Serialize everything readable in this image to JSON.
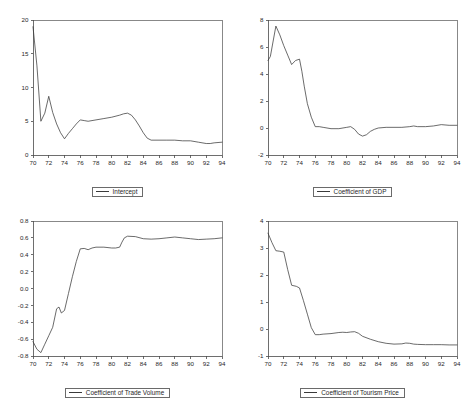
{
  "page": {
    "kind": "recursive-coefficient-estimates-panel",
    "panel_count": 4
  },
  "chart_data": [
    {
      "id": "intercept",
      "type": "line",
      "title": "",
      "xlabel": "",
      "ylabel": "",
      "legend": "Intercept",
      "legend_position": "bottom-center",
      "grid": false,
      "xlim": [
        70,
        94
      ],
      "ylim": [
        0,
        20
      ],
      "xticks": [
        70,
        72,
        74,
        76,
        78,
        80,
        82,
        84,
        86,
        88,
        90,
        92,
        94
      ],
      "yticks": [
        0,
        5,
        10,
        15,
        20
      ],
      "ytick_labels": [
        "0",
        "5",
        "10",
        "15",
        "20"
      ],
      "x": [
        70,
        70.5,
        71,
        71.5,
        72,
        72.5,
        73,
        73.5,
        74,
        74.5,
        75,
        75.5,
        76,
        76.5,
        77,
        78,
        79,
        80,
        81,
        81.5,
        82,
        82.5,
        83,
        83.5,
        84,
        84.5,
        85,
        86,
        87,
        88,
        89,
        90,
        91,
        92,
        92.5,
        93,
        94
      ],
      "values": [
        19.0,
        13.2,
        5.0,
        6.2,
        8.7,
        6.3,
        4.6,
        3.3,
        2.4,
        3.2,
        3.9,
        4.6,
        5.2,
        5.1,
        5.0,
        5.2,
        5.4,
        5.6,
        5.9,
        6.1,
        6.2,
        5.9,
        5.2,
        4.3,
        3.3,
        2.5,
        2.2,
        2.2,
        2.2,
        2.2,
        2.1,
        2.1,
        1.9,
        1.7,
        1.7,
        1.8,
        1.9
      ]
    },
    {
      "id": "coefficient-of-gdp",
      "type": "line",
      "title": "",
      "xlabel": "",
      "ylabel": "",
      "legend": "Coefficient of GDP",
      "legend_position": "bottom-center",
      "grid": false,
      "xlim": [
        70,
        94
      ],
      "ylim": [
        -2,
        8
      ],
      "xticks": [
        70,
        72,
        74,
        76,
        78,
        80,
        82,
        84,
        86,
        88,
        90,
        92,
        94
      ],
      "yticks": [
        -2,
        0,
        2,
        4,
        6,
        8
      ],
      "ytick_labels": [
        "-2",
        "0",
        "2",
        "4",
        "6",
        "8"
      ],
      "x": [
        70,
        70.3,
        71,
        71.5,
        72,
        72.5,
        73,
        73.5,
        74,
        74.3,
        74.6,
        75,
        75.5,
        76,
        76.5,
        77,
        78,
        79,
        80,
        80.5,
        81,
        81.5,
        82,
        82.5,
        83,
        83.5,
        84,
        85,
        86,
        87,
        88,
        88.5,
        89,
        90,
        91,
        92,
        93,
        94
      ],
      "values": [
        5.0,
        5.3,
        7.55,
        6.9,
        6.1,
        5.4,
        4.7,
        5.0,
        5.1,
        4.2,
        3.1,
        1.8,
        0.8,
        0.1,
        0.1,
        0.05,
        -0.05,
        -0.05,
        0.05,
        0.1,
        -0.1,
        -0.45,
        -0.6,
        -0.5,
        -0.25,
        -0.1,
        0.0,
        0.05,
        0.05,
        0.05,
        0.1,
        0.15,
        0.1,
        0.1,
        0.15,
        0.25,
        0.2,
        0.2
      ]
    },
    {
      "id": "coefficient-of-trade-volume",
      "type": "line",
      "title": "",
      "xlabel": "",
      "ylabel": "",
      "legend": "Coefficient of Trade Volume",
      "legend_position": "bottom-center",
      "grid": false,
      "xlim": [
        70,
        94
      ],
      "ylim": [
        -0.8,
        0.8
      ],
      "xticks": [
        70,
        72,
        74,
        76,
        78,
        80,
        82,
        84,
        86,
        88,
        90,
        92,
        94
      ],
      "yticks": [
        -0.8,
        -0.6,
        -0.4,
        -0.2,
        0.0,
        0.2,
        0.4,
        0.6,
        0.8
      ],
      "ytick_labels": [
        "-0.8",
        "-0.6",
        "-0.4",
        "-0.2",
        "0.0",
        "0.2",
        "0.4",
        "0.6",
        "0.8"
      ],
      "x": [
        70,
        70.5,
        71,
        71.5,
        72,
        72.5,
        73,
        73.3,
        73.6,
        74,
        74.5,
        75,
        75.5,
        76,
        76.5,
        77,
        77.5,
        78,
        79,
        80,
        80.5,
        81,
        81.3,
        81.6,
        82,
        83,
        84,
        85,
        86,
        87,
        88,
        89,
        90,
        91,
        92,
        93,
        94
      ],
      "values": [
        -0.63,
        -0.72,
        -0.76,
        -0.66,
        -0.56,
        -0.46,
        -0.24,
        -0.22,
        -0.29,
        -0.26,
        -0.06,
        0.14,
        0.32,
        0.47,
        0.475,
        0.46,
        0.48,
        0.49,
        0.49,
        0.48,
        0.48,
        0.49,
        0.55,
        0.6,
        0.62,
        0.615,
        0.59,
        0.585,
        0.59,
        0.6,
        0.61,
        0.6,
        0.59,
        0.58,
        0.585,
        0.59,
        0.6
      ]
    },
    {
      "id": "coefficient-of-tourism-price",
      "type": "line",
      "title": "",
      "xlabel": "",
      "ylabel": "",
      "legend": "Coefficient of Tourism Price",
      "legend_position": "bottom-center",
      "grid": false,
      "xlim": [
        70,
        94
      ],
      "ylim": [
        -1,
        4
      ],
      "xticks": [
        70,
        72,
        74,
        76,
        78,
        80,
        82,
        84,
        86,
        88,
        90,
        92,
        94
      ],
      "yticks": [
        -1,
        0,
        1,
        2,
        3,
        4
      ],
      "ytick_labels": [
        "-1",
        "0",
        "1",
        "2",
        "3",
        "4"
      ],
      "x": [
        70,
        70.5,
        71,
        71.5,
        72,
        72.5,
        73,
        73.3,
        73.6,
        74,
        74.5,
        75,
        75.5,
        76,
        76.5,
        77,
        78,
        79,
        79.5,
        80,
        80.5,
        81,
        81.5,
        82,
        83,
        84,
        85,
        86,
        87,
        87.5,
        88,
        88.5,
        89,
        90,
        91,
        92,
        93,
        94
      ],
      "values": [
        3.55,
        3.2,
        2.9,
        2.88,
        2.85,
        2.2,
        1.62,
        1.6,
        1.58,
        1.52,
        1.05,
        0.55,
        0.05,
        -0.21,
        -0.21,
        -0.19,
        -0.17,
        -0.13,
        -0.12,
        -0.13,
        -0.11,
        -0.1,
        -0.16,
        -0.27,
        -0.38,
        -0.47,
        -0.53,
        -0.56,
        -0.55,
        -0.52,
        -0.53,
        -0.56,
        -0.57,
        -0.58,
        -0.58,
        -0.58,
        -0.59,
        -0.59
      ]
    }
  ],
  "style": {
    "line_color": "#3a3a3a",
    "axis_color": "#4a4a4a",
    "text_color": "#1f1f1f",
    "background": "#ffffff"
  }
}
